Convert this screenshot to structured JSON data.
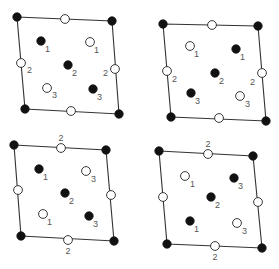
{
  "figure": {
    "colors": {
      "filled": "#111111",
      "open": "#ffffff",
      "edge": "#333333",
      "label": "#555555"
    },
    "panels": [
      {
        "id": "top-left",
        "corners": [
          [
            17,
            17
          ],
          [
            112,
            21
          ],
          [
            119,
            114
          ],
          [
            25,
            109
          ]
        ],
        "points": [
          {
            "x": 17,
            "y": 17,
            "type": "filled"
          },
          {
            "x": 112,
            "y": 21,
            "type": "filled"
          },
          {
            "x": 119,
            "y": 114,
            "type": "filled"
          },
          {
            "x": 25,
            "y": 109,
            "type": "filled"
          },
          {
            "x": 65,
            "y": 19,
            "type": "open"
          },
          {
            "x": 71,
            "y": 111,
            "type": "open"
          },
          {
            "x": 21,
            "y": 63,
            "type": "open",
            "label": "2",
            "lx": 27,
            "ly": 73
          },
          {
            "x": 115,
            "y": 69,
            "type": "open",
            "label": "2",
            "lx": 103,
            "ly": 76
          },
          {
            "x": 41,
            "y": 41,
            "type": "filled",
            "label": "1",
            "lx": 45,
            "ly": 52
          },
          {
            "x": 90,
            "y": 42,
            "type": "open",
            "label": "1",
            "lx": 94,
            "ly": 53
          },
          {
            "x": 68,
            "y": 65,
            "type": "filled",
            "label": "2",
            "lx": 72,
            "ly": 76
          },
          {
            "x": 47,
            "y": 88,
            "type": "open",
            "label": "3",
            "lx": 52,
            "ly": 98
          },
          {
            "x": 93,
            "y": 89,
            "type": "filled",
            "label": "3",
            "lx": 97,
            "ly": 100
          }
        ]
      },
      {
        "id": "top-right",
        "corners": [
          [
            163,
            24
          ],
          [
            258,
            26
          ],
          [
            266,
            121
          ],
          [
            171,
            117
          ]
        ],
        "points": [
          {
            "x": 163,
            "y": 24,
            "type": "filled"
          },
          {
            "x": 258,
            "y": 26,
            "type": "filled"
          },
          {
            "x": 266,
            "y": 121,
            "type": "filled"
          },
          {
            "x": 171,
            "y": 117,
            "type": "filled"
          },
          {
            "x": 212,
            "y": 25,
            "type": "open"
          },
          {
            "x": 219,
            "y": 118,
            "type": "open"
          },
          {
            "x": 167,
            "y": 71,
            "type": "open",
            "label": "2",
            "lx": 172,
            "ly": 82
          },
          {
            "x": 262,
            "y": 73,
            "type": "open",
            "label": "2",
            "lx": 250,
            "ly": 85
          },
          {
            "x": 190,
            "y": 46,
            "type": "open",
            "label": "1",
            "lx": 194,
            "ly": 57
          },
          {
            "x": 236,
            "y": 49,
            "type": "filled",
            "label": "1",
            "lx": 240,
            "ly": 60
          },
          {
            "x": 215,
            "y": 73,
            "type": "filled",
            "label": "2",
            "lx": 219,
            "ly": 84
          },
          {
            "x": 191,
            "y": 93,
            "type": "filled",
            "label": "3",
            "lx": 195,
            "ly": 104
          },
          {
            "x": 240,
            "y": 96,
            "type": "open",
            "label": "3",
            "lx": 245,
            "ly": 107
          }
        ]
      },
      {
        "id": "bottom-left",
        "corners": [
          [
            14,
            145
          ],
          [
            106,
            150
          ],
          [
            114,
            241
          ],
          [
            21,
            236
          ]
        ],
        "top_label": {
          "text": "2",
          "x": 61,
          "y": 141
        },
        "bottom_label": {
          "text": "2",
          "x": 68,
          "y": 254
        },
        "points": [
          {
            "x": 14,
            "y": 145,
            "type": "filled"
          },
          {
            "x": 106,
            "y": 150,
            "type": "filled"
          },
          {
            "x": 114,
            "y": 241,
            "type": "filled"
          },
          {
            "x": 21,
            "y": 236,
            "type": "filled"
          },
          {
            "x": 61,
            "y": 148,
            "type": "open"
          },
          {
            "x": 68,
            "y": 240,
            "type": "open"
          },
          {
            "x": 18,
            "y": 190,
            "type": "open"
          },
          {
            "x": 111,
            "y": 195,
            "type": "open"
          },
          {
            "x": 39,
            "y": 169,
            "type": "filled",
            "label": "1",
            "lx": 43,
            "ly": 180
          },
          {
            "x": 86,
            "y": 171,
            "type": "open",
            "label": "3",
            "lx": 91,
            "ly": 182
          },
          {
            "x": 65,
            "y": 193,
            "type": "filled",
            "label": "2",
            "lx": 69,
            "ly": 204
          },
          {
            "x": 43,
            "y": 214,
            "type": "open",
            "label": "1",
            "lx": 47,
            "ly": 225
          },
          {
            "x": 89,
            "y": 216,
            "type": "filled",
            "label": "3",
            "lx": 93,
            "ly": 227
          }
        ]
      },
      {
        "id": "bottom-right",
        "corners": [
          [
            159,
            151
          ],
          [
            253,
            156
          ],
          [
            262,
            248
          ],
          [
            167,
            244
          ]
        ],
        "top_label": {
          "text": "2",
          "x": 208,
          "y": 147
        },
        "bottom_label": {
          "text": "2",
          "x": 215,
          "y": 260
        },
        "points": [
          {
            "x": 159,
            "y": 151,
            "type": "filled"
          },
          {
            "x": 253,
            "y": 156,
            "type": "filled"
          },
          {
            "x": 262,
            "y": 248,
            "type": "filled"
          },
          {
            "x": 167,
            "y": 244,
            "type": "filled"
          },
          {
            "x": 208,
            "y": 154,
            "type": "open"
          },
          {
            "x": 215,
            "y": 246,
            "type": "open"
          },
          {
            "x": 163,
            "y": 197,
            "type": "open"
          },
          {
            "x": 258,
            "y": 202,
            "type": "open"
          },
          {
            "x": 185,
            "y": 176,
            "type": "open",
            "label": "1",
            "lx": 190,
            "ly": 187
          },
          {
            "x": 234,
            "y": 178,
            "type": "filled",
            "label": "3",
            "lx": 238,
            "ly": 189
          },
          {
            "x": 211,
            "y": 197,
            "type": "filled",
            "label": "2",
            "lx": 215,
            "ly": 208
          },
          {
            "x": 190,
            "y": 221,
            "type": "filled",
            "label": "1",
            "lx": 194,
            "ly": 232
          },
          {
            "x": 237,
            "y": 223,
            "type": "open",
            "label": "3",
            "lx": 242,
            "ly": 234
          }
        ]
      }
    ]
  }
}
